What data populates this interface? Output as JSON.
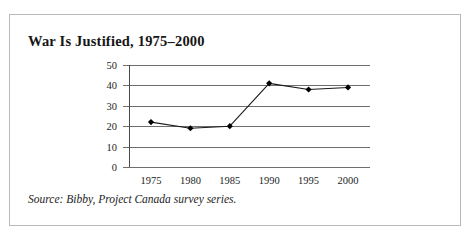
{
  "figure": {
    "title": "War Is Justified, 1975–2000",
    "source_note": "Source: Bibby, Project Canada survey series.",
    "border_color": "#b9b9b9"
  },
  "chart_data": {
    "type": "line",
    "title": "War Is Justified, 1975–2000",
    "subtitle": "",
    "xlabel": "",
    "ylabel": "",
    "categories": [
      "1975",
      "1980",
      "1985",
      "1990",
      "1995",
      "2000"
    ],
    "x": [
      1975,
      1980,
      1985,
      1990,
      1995,
      2000
    ],
    "values": [
      22,
      19,
      20,
      41,
      38,
      39
    ],
    "series": [
      {
        "name": "War Is Justified",
        "values": [
          22,
          19,
          20,
          41,
          38,
          39
        ]
      }
    ],
    "ylim": [
      0,
      50
    ],
    "yticks": [
      0,
      10,
      20,
      30,
      40,
      50
    ],
    "ytick_labels": [
      "0",
      "10",
      "20",
      "30",
      "40",
      "50"
    ],
    "xtick_labels": [
      "1975",
      "1980",
      "1985",
      "1990",
      "1995",
      "2000"
    ],
    "grid": true,
    "grid_axis": "y",
    "legend": false,
    "legend_position": "none",
    "marker": "diamond",
    "marker_color": "#000000",
    "line_color": "#1a1a1a",
    "annotations": []
  }
}
